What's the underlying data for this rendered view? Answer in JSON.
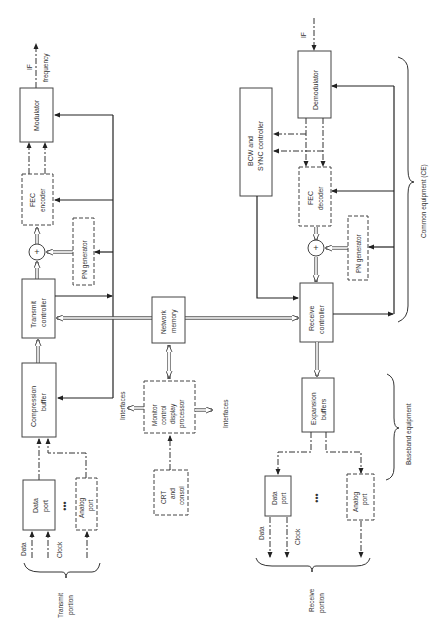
{
  "diagram": {
    "orientation": "rotated 90 degrees counter-clockwise",
    "transmit": {
      "modulator": "Modulator",
      "fec_encoder": [
        "FEC",
        "encoder"
      ],
      "xor_symbol": "+",
      "pn_generator": "PN generator",
      "transmit_controller": [
        "Transmit",
        "controller"
      ],
      "compression_buffer": [
        "Compression",
        "buffer"
      ],
      "data_port": [
        "Data",
        "port"
      ],
      "analog_port": [
        "Analog",
        "port"
      ],
      "ellipsis": "•••",
      "input_data": "Data",
      "input_clock": "Clock",
      "output_if": "IF",
      "output_frequency": "frequency",
      "portion_label": [
        "Transmit",
        "portion"
      ]
    },
    "shared": {
      "network_memory": [
        "Network",
        "memory"
      ],
      "monitor": [
        "Monitor",
        "control",
        "display",
        "processor"
      ],
      "interfaces_left": "Interfaces",
      "interfaces_right": "Interfaces",
      "crt": [
        "CRT",
        "and",
        "consol"
      ]
    },
    "receive": {
      "demodulator": "Demodulator",
      "input_if": "IF",
      "bcw_sync": [
        "BCW and",
        "SYNC controller"
      ],
      "fec_decoder": [
        "FEC",
        "decoder"
      ],
      "xor_symbol": "+",
      "pn_generator": "PN generator",
      "receive_controller": [
        "Receive",
        "controller"
      ],
      "expansion_buffers": [
        "Expansion",
        "buffers"
      ],
      "data_port": [
        "Data",
        "port"
      ],
      "analog_port": [
        "Analog",
        "port"
      ],
      "ellipsis": "•••",
      "output_data": "Data",
      "output_clock": "Clock",
      "portion_label": [
        "Receive",
        "portion"
      ]
    },
    "groups": {
      "common_equipment": "Common equipment (CE)",
      "baseband_equipment": "Baseband equipment"
    }
  }
}
